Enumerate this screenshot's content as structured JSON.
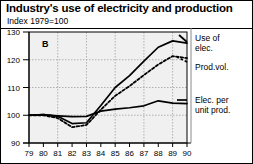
{
  "title": "Industry's use of electricity and production",
  "subtitle": "Index 1979=100",
  "panel_letter": "B",
  "legend": {
    "series1": "Use of\nelec.",
    "series1_line1": "Use of",
    "series1_line2": "elec.",
    "series2": "Prod.vol.",
    "series3_line1": "Elec. per",
    "series3_line2": "unit prod."
  },
  "colors": {
    "line": "#000000",
    "grid": "#b0b0b0",
    "plot_background": "#f0f0f0",
    "axis": "#000000",
    "text": "#000000"
  },
  "chart_data": {
    "type": "line",
    "title": "Industry's use of electricity and production",
    "subtitle": "Index 1979=100",
    "xlabel": "",
    "ylabel": "Index 1979=100",
    "x": [
      "79",
      "80",
      "81",
      "82",
      "83",
      "84",
      "85",
      "86",
      "87",
      "88",
      "89",
      "90"
    ],
    "categories": [
      "79",
      "80",
      "81",
      "82",
      "83",
      "84",
      "85",
      "86",
      "87",
      "88",
      "89",
      "90"
    ],
    "xlim": [
      0,
      11
    ],
    "ylim": [
      90,
      130
    ],
    "yticks": [
      90,
      100,
      110,
      120,
      130
    ],
    "xticks": [
      "79",
      "80",
      "81",
      "82",
      "83",
      "84",
      "85",
      "86",
      "87",
      "88",
      "89",
      "90"
    ],
    "grid": true,
    "legend_position": "right",
    "series": [
      {
        "name": "Use of elec.",
        "style": "solid",
        "values": [
          100.0,
          100.2,
          99.6,
          97.0,
          97.3,
          103.5,
          110.0,
          114.3,
          119.5,
          124.5,
          126.8,
          126.0
        ]
      },
      {
        "name": "Prod.vol.",
        "style": "dotted",
        "values": [
          100.0,
          100.0,
          99.0,
          95.7,
          96.5,
          102.0,
          107.0,
          110.5,
          114.5,
          118.3,
          121.3,
          120.6
        ]
      },
      {
        "name": "Elec. per unit prod.",
        "style": "solid",
        "values": [
          100.0,
          100.2,
          99.8,
          99.5,
          99.6,
          101.5,
          102.2,
          102.7,
          103.4,
          105.2,
          104.4,
          104.2
        ]
      }
    ]
  }
}
